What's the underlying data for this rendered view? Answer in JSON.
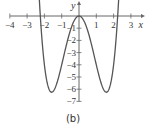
{
  "chart_data": {
    "type": "line",
    "title": "",
    "caption": "(b)",
    "xlabel": "x",
    "ylabel": "y",
    "function": "y = x^4 - 5x^2",
    "xlim": [
      -4,
      3.5
    ],
    "ylim": [
      -7,
      0.8
    ],
    "x_ticks": [
      -4,
      -3,
      -2,
      -1,
      1,
      2,
      3
    ],
    "x_tick_labels": [
      "−4",
      "−3",
      "−2",
      "−1",
      "1",
      "2",
      "3"
    ],
    "y_ticks": [
      -1,
      -2,
      -3,
      -4,
      -5,
      -6,
      -7
    ],
    "y_tick_labels": [
      "−1",
      "−2",
      "−3",
      "−4",
      "−5",
      "−6",
      "−7"
    ],
    "grid": false,
    "series": [
      {
        "name": "curve",
        "x": [
          -2.35,
          -2.236,
          -2.0,
          -1.58,
          -1.0,
          -0.5,
          0,
          0.5,
          1.0,
          1.58,
          2.0,
          2.236,
          2.35
        ],
        "y": [
          0.92,
          0.0,
          -4.0,
          -6.25,
          -4.0,
          -1.19,
          0,
          -1.19,
          -4.0,
          -6.25,
          -4.0,
          0.0,
          0.92
        ]
      }
    ],
    "key_points": {
      "local_max": [
        0,
        0
      ],
      "minima": [
        [
          -1.58,
          -6.25
        ],
        [
          1.58,
          -6.25
        ]
      ],
      "x_intercepts": [
        -2.236,
        0,
        2.236
      ]
    },
    "arrows_on_curve_ends": true
  }
}
